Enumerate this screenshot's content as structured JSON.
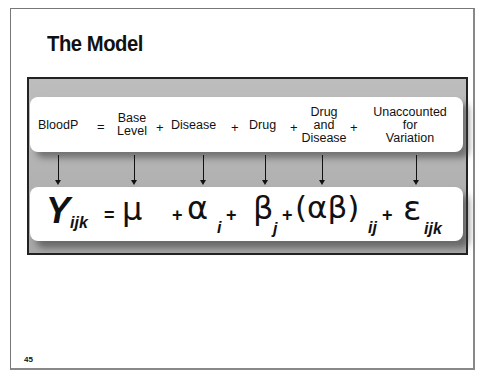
{
  "slide": {
    "title": "The Model",
    "page_number": "45"
  },
  "labels": {
    "response": "BloodP",
    "equals": "=",
    "base_level_1": "Base",
    "base_level_2": "Level",
    "plus1": "+",
    "disease": "Disease",
    "plus2": "+",
    "drug": "Drug",
    "plus3": "+",
    "interaction_1": "Drug",
    "interaction_2": "and",
    "interaction_3": "Disease",
    "plus4": "+",
    "error_1": "Unaccounted",
    "error_2": "for",
    "error_3": "Variation"
  },
  "formula": {
    "response_symbol": "Y",
    "response_sub": "ijk",
    "equals": "=",
    "mu": "μ",
    "plus1": "+",
    "alpha": "α",
    "alpha_sub": "i",
    "plus2": "+",
    "beta": "β",
    "beta_sub": "j",
    "plus3": "+",
    "interaction": "(αβ)",
    "interaction_sub": "ij",
    "plus4": "+",
    "epsilon": "ε",
    "epsilon_sub": "ijk"
  },
  "colors": {
    "panel_gray": "#b5b5b5",
    "text": "#111111",
    "box": "#ffffff"
  }
}
